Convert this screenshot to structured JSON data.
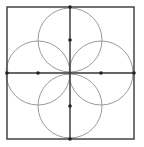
{
  "diagram": {
    "title": "",
    "canvas": {
      "width": 144,
      "height": 147,
      "background": "#ffffff"
    },
    "square": {
      "x": 7,
      "y": 7,
      "width": 127,
      "height": 132,
      "stroke": "#444444",
      "stroke_width": 1.5
    },
    "axes": {
      "vertical": {
        "x1": 70,
        "y1": 7,
        "x2": 70,
        "y2": 139,
        "stroke": "#333333",
        "stroke_width": 1.4
      },
      "horizontal": {
        "x1": 7,
        "y1": 73,
        "x2": 134,
        "y2": 73,
        "stroke": "#333333",
        "stroke_width": 1.4
      }
    },
    "circles": [
      {
        "name": "top",
        "cx": 70,
        "cy": 40,
        "r": 32,
        "stroke": "#9a9a9a"
      },
      {
        "name": "left",
        "cx": 38,
        "cy": 73,
        "r": 32,
        "stroke": "#9a9a9a"
      },
      {
        "name": "right",
        "cx": 101,
        "cy": 73,
        "r": 32,
        "stroke": "#9a9a9a"
      },
      {
        "name": "bottom",
        "cx": 70,
        "cy": 106,
        "r": 32,
        "stroke": "#9a9a9a"
      }
    ],
    "points": [
      {
        "name": "top-edge-midpoint",
        "cx": 70,
        "cy": 7
      },
      {
        "name": "top-circle-center",
        "cx": 70,
        "cy": 40
      },
      {
        "name": "left-edge-midpoint",
        "cx": 7,
        "cy": 73
      },
      {
        "name": "left-circle-center",
        "cx": 38,
        "cy": 73
      },
      {
        "name": "right-circle-center",
        "cx": 101,
        "cy": 73
      },
      {
        "name": "right-edge-midpoint",
        "cx": 134,
        "cy": 73
      },
      {
        "name": "bottom-circle-center",
        "cx": 70,
        "cy": 106
      },
      {
        "name": "bottom-edge-midpoint",
        "cx": 70,
        "cy": 139
      }
    ],
    "point_radius": 1.8,
    "point_color": "#222222"
  }
}
